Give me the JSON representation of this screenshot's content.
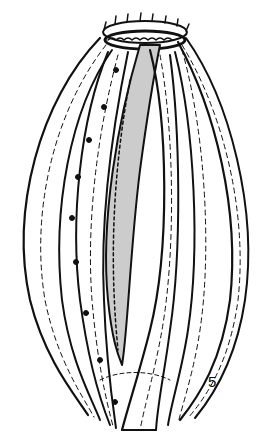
{
  "figure": {
    "number": "5",
    "ink_color": "#111111",
    "background": "#ffffff"
  }
}
